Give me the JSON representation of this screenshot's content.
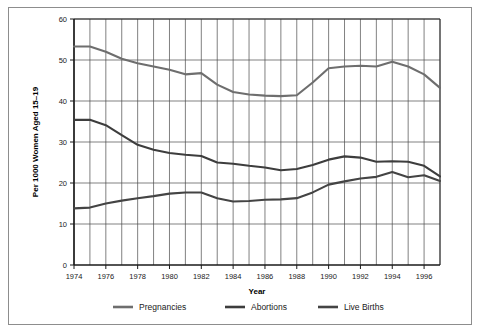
{
  "chart_data": {
    "type": "line",
    "title": "",
    "xlabel": "Year",
    "ylabel": "Per 1000 Women Aged 15–19",
    "xlim": [
      1974,
      1997
    ],
    "ylim": [
      0,
      60
    ],
    "grid": true,
    "legend_position": "bottom",
    "x": [
      1974,
      1975,
      1976,
      1977,
      1978,
      1979,
      1980,
      1981,
      1982,
      1983,
      1984,
      1985,
      1986,
      1987,
      1988,
      1989,
      1990,
      1991,
      1992,
      1993,
      1994,
      1995,
      1996,
      1997
    ],
    "xticks": [
      "1974",
      "1976",
      "1978",
      "1980",
      "1982",
      "1984",
      "1986",
      "1988",
      "1990",
      "1992",
      "1994",
      "1996"
    ],
    "xtick_values": [
      1974,
      1976,
      1978,
      1980,
      1982,
      1984,
      1986,
      1988,
      1990,
      1992,
      1994,
      1996
    ],
    "yticks": [
      "0",
      "10",
      "20",
      "30",
      "40",
      "50",
      "60"
    ],
    "ytick_values": [
      0,
      10,
      20,
      30,
      40,
      50,
      60
    ],
    "series": [
      {
        "name": "Pregnancies",
        "color": "#6e6e6e",
        "values": [
          53.3,
          53.3,
          52.0,
          50.3,
          49.2,
          48.4,
          47.6,
          46.5,
          46.8,
          44.0,
          42.2,
          41.6,
          41.3,
          41.2,
          41.4,
          44.5,
          48.0,
          48.4,
          48.6,
          48.4,
          49.6,
          48.4,
          46.5,
          43.2
        ]
      },
      {
        "name": "Abortions",
        "color": "#3d3d3d",
        "values": [
          35.4,
          35.4,
          34.1,
          31.7,
          29.3,
          28.1,
          27.3,
          26.9,
          26.6,
          25.0,
          24.7,
          24.2,
          23.8,
          23.1,
          23.4,
          24.4,
          25.7,
          26.5,
          26.2,
          25.2,
          25.3,
          25.2,
          24.2,
          21.6
        ]
      },
      {
        "name": "Live Births",
        "color": "#444444",
        "values": [
          13.8,
          14.0,
          15.0,
          15.7,
          16.3,
          16.8,
          17.4,
          17.7,
          17.7,
          16.3,
          15.5,
          15.6,
          15.9,
          16.0,
          16.3,
          17.7,
          19.6,
          20.4,
          21.1,
          21.5,
          22.7,
          21.4,
          21.9,
          20.5
        ]
      }
    ]
  },
  "legend": {
    "items": [
      {
        "label": "Pregnancies"
      },
      {
        "label": "Abortions"
      },
      {
        "label": "Live Births"
      }
    ]
  },
  "axes": {
    "x_title": "Year",
    "y_title": "Per 1000 Women Aged 15–19"
  }
}
